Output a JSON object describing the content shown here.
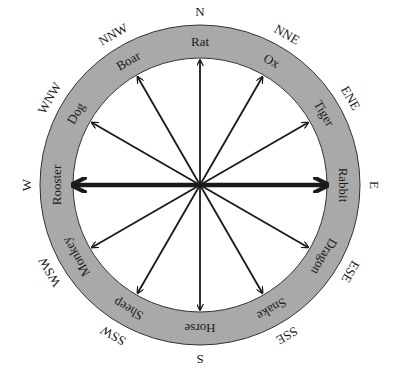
{
  "diagram": {
    "title": "",
    "center": [
      200,
      185
    ],
    "outer_radius": 160,
    "inner_radius": 127,
    "ring_color": "#a9a9a9",
    "arrow_color": "#1a1a1a",
    "animals": [
      {
        "name": "Rat",
        "angle": 0
      },
      {
        "name": "Ox",
        "angle": 30
      },
      {
        "name": "Tiger",
        "angle": 60
      },
      {
        "name": "Rabbit",
        "angle": 90
      },
      {
        "name": "Dragon",
        "angle": 120
      },
      {
        "name": "Snake",
        "angle": 150
      },
      {
        "name": "Horse",
        "angle": 180
      },
      {
        "name": "Sheep",
        "angle": 210
      },
      {
        "name": "Monkey",
        "angle": 240
      },
      {
        "name": "Rooster",
        "angle": 270
      },
      {
        "name": "Dog",
        "angle": 300
      },
      {
        "name": "Boar",
        "angle": 330
      }
    ],
    "directions": [
      {
        "name": "N",
        "angle": 0
      },
      {
        "name": "NNE",
        "angle": 30
      },
      {
        "name": "ENE",
        "angle": 60
      },
      {
        "name": "E",
        "angle": 90
      },
      {
        "name": "ESE",
        "angle": 120
      },
      {
        "name": "SSE",
        "angle": 150
      },
      {
        "name": "S",
        "angle": 180
      },
      {
        "name": "SSW",
        "angle": 210
      },
      {
        "name": "WSW",
        "angle": 240
      },
      {
        "name": "W",
        "angle": 270
      },
      {
        "name": "WNW",
        "angle": 300
      },
      {
        "name": "NNW",
        "angle": 330
      }
    ],
    "bold_axis": [
      "Rabbit",
      "Rooster"
    ]
  }
}
